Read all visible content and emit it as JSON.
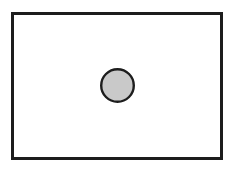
{
  "canvas": {
    "width": 233,
    "height": 169,
    "background_color": "#ffffff",
    "description": "Line-art diagram: a thin dark rectangular frame enclosing a single small gray filled circle."
  },
  "figure": {
    "title": "",
    "frame": {
      "name": "outer-rectangle",
      "shape": "rectangle",
      "x": 12.5,
      "y": 13.5,
      "width": 209,
      "height": 145,
      "fill_color": "#ffffff",
      "stroke_color": "#1d1d1d",
      "stroke_width": 2.1
    },
    "shapes": [
      {
        "name": "center-circle",
        "shape": "circle",
        "center_x": 117.5,
        "center_y": 85.5,
        "radius": 16.3,
        "diameter": 32.6,
        "fill_color": "#c9c9c9",
        "stroke_color": "#1d1d1d",
        "stroke_width": 2.4,
        "label": ""
      }
    ],
    "artifacts": [
      {
        "name": "scan-speck",
        "x": 107,
        "y": 19,
        "width": 2,
        "height": 5,
        "color": "#ededed",
        "opacity": 0.55
      }
    ]
  }
}
